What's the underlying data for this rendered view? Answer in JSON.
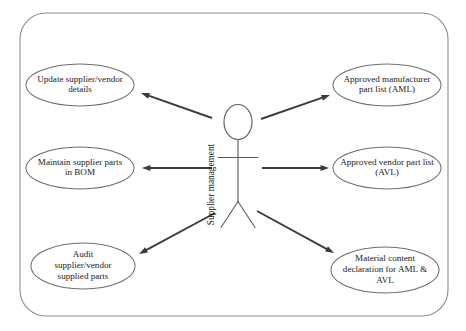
{
  "diagram": {
    "type": "uml-use-case-diagram",
    "boundary": {
      "name": "system-boundary",
      "x": 20,
      "y": 13,
      "width": 428,
      "height": 303,
      "corner_radius": 26,
      "stroke_color": "#8c8c90"
    },
    "actor": {
      "name": "supplier-management-actor",
      "label": "Supplier management",
      "label_orientation": "vertical-bottom-to-top",
      "center_x": 238,
      "head_center_y": 122,
      "stroke_color": "#5f5f64"
    },
    "use_cases": [
      {
        "id": "update-supplier-vendor-details",
        "lines": [
          "Update supplier/vendor",
          "details"
        ],
        "cx": 80,
        "cy": 85,
        "rx": 54,
        "ry": 21
      },
      {
        "id": "maintain-supplier-parts-in-bom",
        "lines": [
          "Maintain supplier parts",
          "in BOM"
        ],
        "cx": 80,
        "cy": 168,
        "rx": 54,
        "ry": 21
      },
      {
        "id": "audit-supplier-vendor-supplied-parts",
        "lines": [
          "Audit",
          "supplier/vendor",
          "supplied parts"
        ],
        "cx": 83,
        "cy": 266,
        "rx": 52,
        "ry": 23
      },
      {
        "id": "approved-manufacturer-part-list-aml",
        "lines": [
          "Approved manufacturer",
          "part list (AML)"
        ],
        "cx": 387,
        "cy": 85,
        "rx": 54,
        "ry": 21
      },
      {
        "id": "approved-vendor-part-list-avl",
        "lines": [
          "Approved vendor part list",
          "(AVL)"
        ],
        "cx": 387,
        "cy": 168,
        "rx": 54,
        "ry": 21
      },
      {
        "id": "material-content-declaration-for-aml-avl",
        "lines": [
          "Material content",
          "declaration for AML &",
          "AVL"
        ],
        "cx": 385,
        "cy": 270,
        "rx": 54,
        "ry": 23
      }
    ],
    "associations": [
      {
        "id": "assoc-actor-to-update-supplier-vendor-details",
        "from": "supplier-management-actor",
        "to": "update-supplier-vendor-details",
        "x1": 212,
        "y1": 118,
        "x2": 141,
        "y2": 93,
        "arrow_at": "target"
      },
      {
        "id": "assoc-actor-to-maintain-supplier-parts-in-bom",
        "from": "supplier-management-actor",
        "to": "maintain-supplier-parts-in-bom",
        "x1": 212,
        "y1": 168,
        "x2": 142,
        "y2": 168,
        "arrow_at": "target"
      },
      {
        "id": "assoc-actor-to-audit-supplier-vendor-supplied-parts",
        "from": "supplier-management-actor",
        "to": "audit-supplier-vendor-supplied-parts",
        "x1": 215,
        "y1": 213,
        "x2": 139,
        "y2": 254,
        "arrow_at": "target"
      },
      {
        "id": "assoc-actor-to-approved-manufacturer-part-list-aml",
        "from": "supplier-management-actor",
        "to": "approved-manufacturer-part-list-aml",
        "x1": 261,
        "y1": 119,
        "x2": 330,
        "y2": 95,
        "arrow_at": "target"
      },
      {
        "id": "assoc-actor-to-approved-vendor-part-list-avl",
        "from": "supplier-management-actor",
        "to": "approved-vendor-part-list-avl",
        "x1": 262,
        "y1": 168,
        "x2": 329,
        "y2": 168,
        "arrow_at": "target"
      },
      {
        "id": "assoc-actor-to-material-content-declaration",
        "from": "supplier-management-actor",
        "to": "material-content-declaration-for-aml-avl",
        "x1": 257,
        "y1": 211,
        "x2": 334,
        "y2": 253,
        "arrow_at": "target"
      }
    ]
  }
}
